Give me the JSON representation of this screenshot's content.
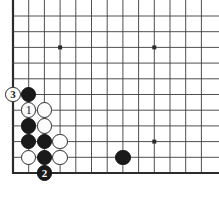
{
  "figure": {
    "kind": "go-board-diagram",
    "title": "",
    "board_background": "#ffffff",
    "line_color": "#3c3c3c",
    "edge_color": "#2b2b2b",
    "black_color": "#1a1a1a",
    "white_color": "#fdfdfd",
    "columns": 13,
    "rows": 11,
    "spacing": 15.7,
    "origin_x": 13,
    "origin_y": 16,
    "edges": {
      "left": true,
      "bottom": true,
      "top": false,
      "right": false
    }
  },
  "star_points": [
    {
      "name": "star-point-upper-left",
      "col": 3,
      "row": 2
    },
    {
      "name": "star-point-upper-right",
      "col": 9,
      "row": 2
    },
    {
      "name": "star-point-lower-right",
      "col": 9,
      "row": 8
    }
  ],
  "stones": [
    {
      "id": "black-stone-a",
      "color": "black",
      "col": 1,
      "row": 5,
      "label": ""
    },
    {
      "id": "white-stone-move-1",
      "color": "white",
      "col": 1,
      "row": 6,
      "label": "1"
    },
    {
      "id": "white-stone-b",
      "color": "white",
      "col": 2,
      "row": 6,
      "label": ""
    },
    {
      "id": "black-stone-c",
      "color": "black",
      "col": 1,
      "row": 7,
      "label": ""
    },
    {
      "id": "white-stone-d",
      "color": "white",
      "col": 2,
      "row": 7,
      "label": ""
    },
    {
      "id": "black-stone-e",
      "color": "black",
      "col": 1,
      "row": 8,
      "label": ""
    },
    {
      "id": "black-stone-f",
      "color": "black",
      "col": 2,
      "row": 8,
      "label": ""
    },
    {
      "id": "white-stone-g",
      "color": "white",
      "col": 3,
      "row": 8,
      "label": ""
    },
    {
      "id": "white-stone-h",
      "color": "white",
      "col": 1,
      "row": 9,
      "label": ""
    },
    {
      "id": "black-stone-i",
      "color": "black",
      "col": 2,
      "row": 9,
      "label": ""
    },
    {
      "id": "white-stone-j",
      "color": "white",
      "col": 3,
      "row": 9,
      "label": ""
    },
    {
      "id": "black-stone-move-2",
      "color": "black",
      "col": 2,
      "row": 10,
      "label": "2"
    },
    {
      "id": "white-stone-move-3",
      "color": "white",
      "col": 0,
      "row": 5,
      "label": "3"
    },
    {
      "id": "black-stone-right",
      "color": "black",
      "col": 7,
      "row": 9,
      "label": ""
    }
  ],
  "move_labels": {
    "move_1": "1",
    "move_2": "2",
    "move_3": "3"
  }
}
